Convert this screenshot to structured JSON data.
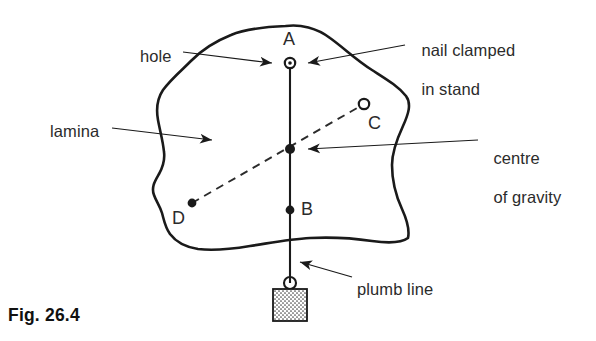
{
  "figure": {
    "caption": "Fig. 26.4",
    "background_color": "#ffffff",
    "ink_color": "#1a1a1a"
  },
  "annotations": {
    "hole": {
      "text": "hole",
      "x": 140,
      "y": 47
    },
    "lamina": {
      "text": "lamina",
      "x": 50,
      "y": 122
    },
    "nail_clamped": {
      "line1": "nail clamped",
      "line2": "in stand",
      "x": 412,
      "y": 22
    },
    "centre_of_gravity": {
      "line1": "centre",
      "line2": "of gravity",
      "x": 484,
      "y": 130
    },
    "plumb_line": {
      "text": "plumb line",
      "x": 357,
      "y": 280
    }
  },
  "points": [
    {
      "id": "A",
      "label": "A",
      "kind": "hole-with-nail",
      "x": 290,
      "y": 63,
      "label_x": 283,
      "label_y": 29
    },
    {
      "id": "G",
      "label": "",
      "kind": "centre-of-gravity-dot",
      "x": 290,
      "y": 149
    },
    {
      "id": "B",
      "label": "B",
      "kind": "marked-dot",
      "x": 290,
      "y": 210,
      "label_x": 301,
      "label_y": 199
    },
    {
      "id": "C",
      "label": "C",
      "kind": "hole",
      "x": 364,
      "y": 104,
      "label_x": 368,
      "label_y": 113
    },
    {
      "id": "D",
      "label": "D",
      "kind": "marked-dot",
      "x": 192,
      "y": 203,
      "label_x": 172,
      "label_y": 208
    }
  ],
  "geometry": {
    "lamina_outline": "M 286,26 C 300,24 317,28 330,38 C 344,48 356,60 372,70 C 386,79 398,86 406,96 C 412,104 408,115 403,126 C 397,139 392,152 392,165 C 392,180 396,196 402,209 C 407,220 410,229 408,238 C 400,244 386,243 372,241 C 352,238 331,237 310,238 C 290,239 270,243 250,246 C 232,249 214,251 198,249 C 185,247 176,242 170,234 C 165,227 164,220 162,213 C 160,206 156,201 154,195 C 151,187 155,181 159,174 C 163,167 165,160 164,152 C 163,141 160,131 158,120 C 156,109 157,99 163,90 C 171,79 182,70 192,60 C 203,49 216,41 231,35 C 245,29 262,27 286,26",
    "plumb_line": {
      "x": 290,
      "y_top": 63,
      "y_bottom": 283
    },
    "dashed_line": {
      "x1": 192,
      "y1": 203,
      "x2": 364,
      "y2": 104
    },
    "bob": {
      "x": 273,
      "y": 289,
      "width": 34,
      "height": 32,
      "ring_cx": 290,
      "ring_cy": 283,
      "ring_r": 6
    }
  },
  "leaders": [
    {
      "name": "hole-leader",
      "from_x": 183,
      "from_y": 52,
      "to_x": 272,
      "to_y": 63
    },
    {
      "name": "lamina-leader",
      "from_x": 112,
      "from_y": 128,
      "to_x": 212,
      "to_y": 140
    },
    {
      "name": "nail-leader",
      "from_x": 405,
      "from_y": 45,
      "to_x": 308,
      "to_y": 63
    },
    {
      "name": "cg-leader",
      "from_x": 478,
      "from_y": 140,
      "to_x": 308,
      "to_y": 149
    },
    {
      "name": "plumb-leader",
      "from_x": 352,
      "from_y": 277,
      "to_x": 300,
      "to_y": 262
    }
  ]
}
